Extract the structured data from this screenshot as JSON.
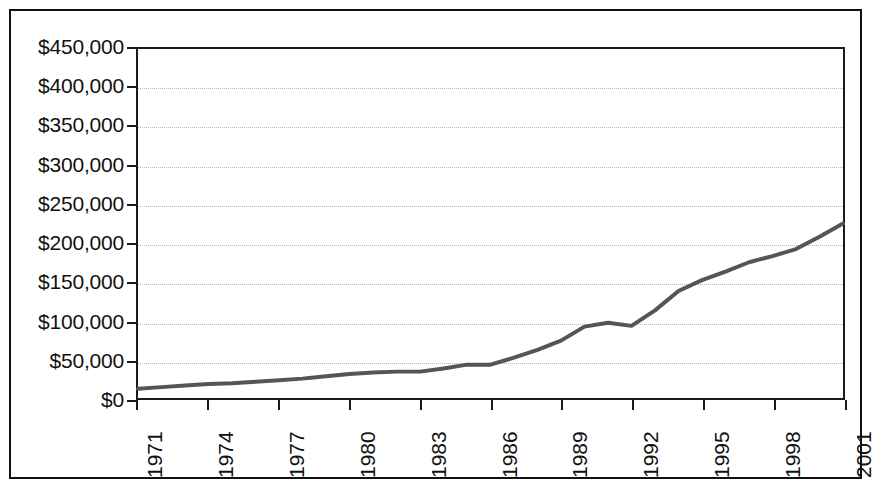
{
  "chart_data": {
    "type": "line",
    "title": "",
    "subtitle": "",
    "xlabel": "",
    "ylabel": "",
    "xlim": [
      1971,
      2001
    ],
    "ylim": [
      0,
      450000
    ],
    "ytick_step": 50000,
    "xtick_step": 3,
    "grid": true,
    "legend": false,
    "legend_position": "none",
    "y_tick_labels": [
      "$450,000",
      "$400,000",
      "$350,000",
      "$300,000",
      "$250,000",
      "$200,000",
      "$150,000",
      "$100,000",
      "$50,000",
      "$0"
    ],
    "y_tick_values": [
      450000,
      400000,
      350000,
      300000,
      250000,
      200000,
      150000,
      100000,
      50000,
      0
    ],
    "x_tick_labels": [
      "1971",
      "1974",
      "1977",
      "1980",
      "1983",
      "1986",
      "1989",
      "1992",
      "1995",
      "1998",
      "2001"
    ],
    "x_tick_values": [
      1971,
      1974,
      1977,
      1980,
      1983,
      1986,
      1989,
      1992,
      1995,
      1998,
      2001
    ],
    "x": [
      1971,
      1972,
      1973,
      1974,
      1975,
      1976,
      1977,
      1978,
      1979,
      1980,
      1981,
      1982,
      1983,
      1984,
      1985,
      1986,
      1987,
      1988,
      1989,
      1990,
      1991,
      1992,
      1993,
      1994,
      1995,
      1996,
      1997,
      1998,
      1999,
      2000,
      2001
    ],
    "values": [
      12000,
      14000,
      16000,
      18000,
      19000,
      21000,
      23000,
      25000,
      28000,
      31000,
      33000,
      34000,
      34000,
      38000,
      43000,
      43000,
      52000,
      62000,
      74000,
      92000,
      97000,
      93000,
      113000,
      138000,
      152000,
      163000,
      175000,
      183000,
      192000,
      208000,
      225000
    ],
    "series": [
      {
        "name": "value",
        "color": "#555555",
        "values": [
          12000,
          14000,
          16000,
          18000,
          19000,
          21000,
          23000,
          25000,
          28000,
          31000,
          33000,
          34000,
          34000,
          38000,
          43000,
          43000,
          52000,
          62000,
          74000,
          92000,
          97000,
          93000,
          113000,
          138000,
          152000,
          163000,
          175000,
          183000,
          192000,
          208000,
          225000
        ]
      }
    ],
    "points": [
      {
        "x": 1971,
        "y": 12000
      },
      {
        "x": 1972,
        "y": 14000
      },
      {
        "x": 1973,
        "y": 16000
      },
      {
        "x": 1974,
        "y": 18000
      },
      {
        "x": 1975,
        "y": 19000
      },
      {
        "x": 1976,
        "y": 21000
      },
      {
        "x": 1977,
        "y": 23000
      },
      {
        "x": 1978,
        "y": 25000
      },
      {
        "x": 1979,
        "y": 28000
      },
      {
        "x": 1980,
        "y": 31000
      },
      {
        "x": 1981,
        "y": 33000
      },
      {
        "x": 1982,
        "y": 34000
      },
      {
        "x": 1983,
        "y": 34000
      },
      {
        "x": 1984,
        "y": 38000
      },
      {
        "x": 1985,
        "y": 43000
      },
      {
        "x": 1986,
        "y": 43000
      },
      {
        "x": 1987,
        "y": 52000
      },
      {
        "x": 1988,
        "y": 62000
      },
      {
        "x": 1989,
        "y": 74000
      },
      {
        "x": 1990,
        "y": 92000
      },
      {
        "x": 1991,
        "y": 97000
      },
      {
        "x": 1992,
        "y": 93000
      },
      {
        "x": 1993,
        "y": 113000
      },
      {
        "x": 1994,
        "y": 138000
      },
      {
        "x": 1995,
        "y": 152000
      },
      {
        "x": 1996,
        "y": 163000
      },
      {
        "x": 1997,
        "y": 175000
      },
      {
        "x": 1998,
        "y": 183000
      },
      {
        "x": 1999,
        "y": 192000
      },
      {
        "x": 2000,
        "y": 208000
      },
      {
        "x": 2001,
        "y": 225000
      }
    ],
    "line_color": "#555555",
    "line_width": 4,
    "grid_color": "#b9b9b9",
    "axis_color": "#1a1a1a",
    "background": "#ffffff"
  }
}
